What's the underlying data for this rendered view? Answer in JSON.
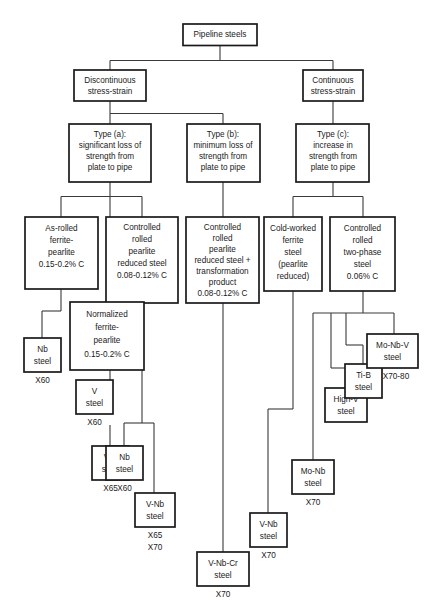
{
  "diagram": {
    "type": "tree-diagram",
    "root": {
      "id": "root",
      "label": "Pipeline steels"
    },
    "level2": [
      {
        "id": "discontinuous",
        "lines": [
          "Discontinuous",
          "stress-strain"
        ]
      },
      {
        "id": "continuous",
        "lines": [
          "Continuous",
          "stress-strain"
        ]
      }
    ],
    "level3": [
      {
        "id": "type_a",
        "lines": [
          "Type (a):",
          "significant loss of",
          "strength from",
          "plate to pipe"
        ]
      },
      {
        "id": "type_b",
        "lines": [
          "Type (b):",
          "minimum loss of",
          "strength from",
          "plate to pipe"
        ]
      },
      {
        "id": "type_c",
        "lines": [
          "Type (c):",
          "increase in",
          "strength from",
          "plate to pipe"
        ]
      }
    ],
    "level4": [
      {
        "id": "as_rolled",
        "lines": [
          "As-rolled",
          "ferrite-",
          "pearlite",
          "0.15-0.2% C"
        ]
      },
      {
        "id": "cr_pearlite_reduced",
        "lines": [
          "Controlled",
          "rolled",
          "pearlite",
          "reduced steel",
          "0.08-0.12% C"
        ]
      },
      {
        "id": "cr_pearlite_transform",
        "lines": [
          "Controlled",
          "rolled",
          "pearlite",
          "reduced steel +",
          "transformation",
          "product",
          "0.08-0.12% C"
        ]
      },
      {
        "id": "cold_worked",
        "lines": [
          "Cold-worked",
          "ferrite",
          "steel",
          "(pearlite",
          "reduced)"
        ]
      },
      {
        "id": "cr_two_phase",
        "lines": [
          "Controlled",
          "rolled",
          "two-phase",
          "steel",
          "0.06% C"
        ]
      }
    ],
    "level5": [
      {
        "id": "normalized",
        "lines": [
          "Normalized",
          "ferrite-",
          "pearlite",
          "0.15-0.2% C"
        ]
      }
    ],
    "leaves": [
      {
        "id": "nb_x60_a",
        "lines": [
          "Nb",
          "steel"
        ],
        "grade": [
          "X60"
        ]
      },
      {
        "id": "v_x60",
        "lines": [
          "V",
          "steel"
        ],
        "grade": [
          "X60"
        ]
      },
      {
        "id": "vn_x65",
        "lines": [
          "V-N",
          "steel"
        ],
        "grade": [
          "X65"
        ]
      },
      {
        "id": "nb_x60_b",
        "lines": [
          "Nb",
          "steel"
        ],
        "grade": [
          "X60"
        ]
      },
      {
        "id": "vnb_x65_x70",
        "lines": [
          "V-Nb",
          "steel"
        ],
        "grade": [
          "X65",
          "X70"
        ]
      },
      {
        "id": "vnbcr_x70",
        "lines": [
          "V-Nb-Cr",
          "steel"
        ],
        "grade": [
          "X70"
        ]
      },
      {
        "id": "vnb_x70",
        "lines": [
          "V-Nb",
          "steel"
        ],
        "grade": [
          "X70"
        ]
      },
      {
        "id": "monb_x70",
        "lines": [
          "Mo-Nb",
          "steel"
        ],
        "grade": [
          "X70"
        ]
      },
      {
        "id": "highv",
        "lines": [
          "High-V",
          "steel"
        ],
        "grade": []
      },
      {
        "id": "tib",
        "lines": [
          "Ti-B",
          "steel"
        ],
        "grade": []
      },
      {
        "id": "monbv_x70_80",
        "lines": [
          "Mo-Nb-V",
          "steel"
        ],
        "grade": [
          "X70-80"
        ]
      }
    ]
  },
  "colors": {
    "background": "#ffffff",
    "box_stroke": "#1a1a1a",
    "connector": "#3a3a3a",
    "text": "#1a1a1a"
  }
}
